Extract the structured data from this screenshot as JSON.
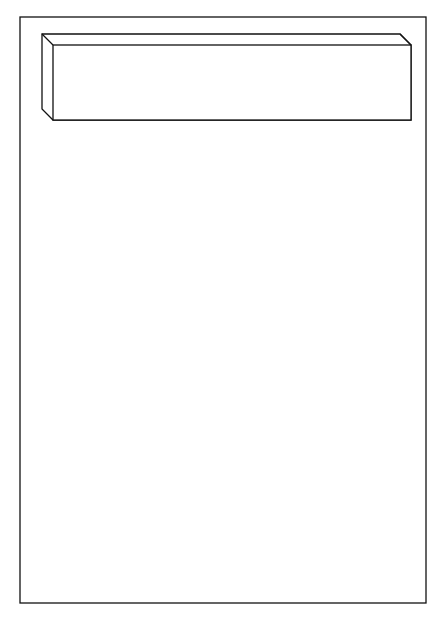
{
  "diagram": {
    "dos_client": {
      "label_line1": "DOS",
      "label_line2": "Client Components",
      "client_desktop": {
        "label_line1": "Client",
        "label_line2": "Desktop",
        "items": [
          {
            "line1": "Work",
            "line2": "to do"
          },
          {
            "line1": "Document",
            "line2": "Manager"
          },
          {
            "line1": "Shared",
            "line2": "Cards"
          },
          {
            "line1": "Appointment",
            "line2": "Manager"
          }
        ]
      },
      "develop_admin_desktop": {
        "label_line1": "Develop.",
        "label_line2": "Admin.",
        "label_line3": "Desktop",
        "items": [
          {
            "line1": "Workflow",
            "line2": "Manager"
          },
          {
            "line1": "Workflow",
            "line2": "Workbench"
          },
          {
            "line1": "Utilities",
            "line2": ""
          }
        ]
      },
      "work_to_do_notify": {
        "line1": "Work to do",
        "line2": "Notify"
      },
      "window_manager": {
        "line1": "Workflow",
        "line2": "Automation",
        "line3": "System",
        "line4": "Window",
        "line5": "Manager"
      }
    },
    "server": {
      "os_label": "Unix",
      "label_line1": "Workflow Automation",
      "label_line2": "System (Server)",
      "notify_program": {
        "line1": "Notify",
        "line2": "Program"
      },
      "task_progressor": {
        "line1": "Task",
        "line2": "Progressor"
      },
      "run_time_system": {
        "line1": "Run Time",
        "line2": "System"
      },
      "database_segments": [
        {
          "line1": "Task",
          "line2": "Data"
        },
        {
          "line1": "Task",
          "line2": "Status File"
        },
        {
          "line1": "Workflow",
          "line2": "Schemas"
        }
      ],
      "tools": {
        "label": "Tools"
      }
    }
  }
}
